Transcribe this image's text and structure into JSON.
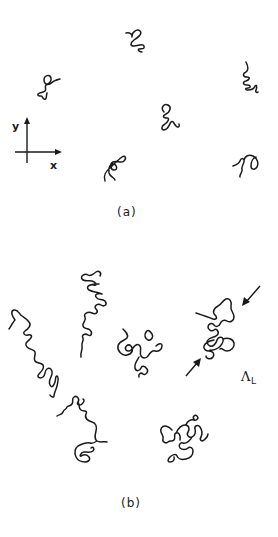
{
  "figure": {
    "panel_a": {
      "caption": "(a)",
      "axes": {
        "x_label": "x",
        "y_label": "y"
      },
      "chains": [
        {
          "id": "a1",
          "description": "small coil, top center"
        },
        {
          "id": "a2",
          "description": "small coil with tail, upper left"
        },
        {
          "id": "a3",
          "description": "zig-zag coil, upper right"
        },
        {
          "id": "a4",
          "description": "small coil, center"
        },
        {
          "id": "a5",
          "description": "knotted coil, lower center-left"
        },
        {
          "id": "a6",
          "description": "looped coil, lower right"
        }
      ]
    },
    "panel_b": {
      "caption": "(b)",
      "annotation": {
        "symbol": "Λ",
        "subscript": "L"
      },
      "chains": [
        {
          "id": "b1",
          "description": "extended chain, upper left-center"
        },
        {
          "id": "b2",
          "description": "extended diagonal chain, far left"
        },
        {
          "id": "b3",
          "description": "compact spiral coil, center"
        },
        {
          "id": "b4",
          "description": "chain compressed between two arrows, right"
        },
        {
          "id": "b5",
          "description": "chain with crossing tail, lower left-center"
        },
        {
          "id": "b6",
          "description": "compact looped coil, lower right"
        }
      ]
    },
    "colors": {
      "ink": "#1a1a1a",
      "background": "#ffffff"
    }
  }
}
